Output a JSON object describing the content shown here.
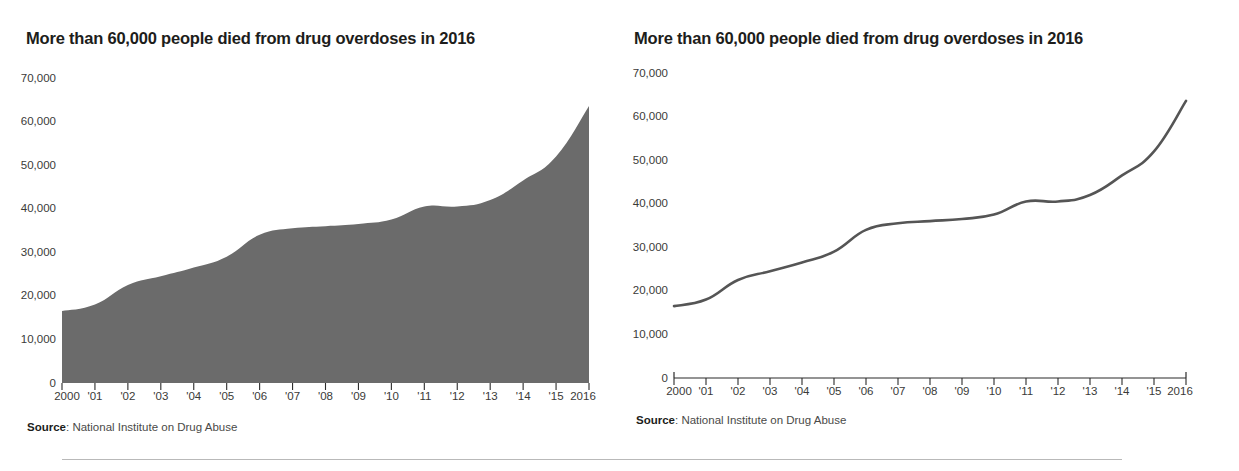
{
  "panels": [
    {
      "key": "area",
      "title": "More than 60,000 people died from drug overdoses in 2016",
      "source_label": "Source",
      "source_text": ": National Institute on Drug Abuse"
    },
    {
      "key": "line",
      "title": "More than 60,000 people died from drug overdoses in 2016",
      "source_label": "Source",
      "source_text": ": National Institute on Drug Abuse"
    }
  ],
  "colors": {
    "area_fill": "#6b6b6b",
    "line_stroke": "#555555",
    "axis": "#2b2b2b",
    "text": "#1d1d1b",
    "divider": "#b9b9b9"
  },
  "chart_data": [
    {
      "type": "area",
      "title": "More than 60,000 people died from drug overdoses in 2016",
      "xlabel": "",
      "ylabel": "",
      "ylim": [
        0,
        70000
      ],
      "xlim": [
        2000,
        2016
      ],
      "grid": false,
      "legend": "none",
      "ytick_labels": [
        "70,000",
        "60,000",
        "50,000",
        "40,000",
        "30,000",
        "20,000",
        "10,000",
        "0"
      ],
      "ytick_values": [
        70000,
        60000,
        50000,
        40000,
        30000,
        20000,
        10000,
        0
      ],
      "xtick_labels": [
        "2000",
        "'01",
        "'02",
        "'03",
        "'04",
        "'05",
        "'06",
        "'07",
        "'08",
        "'09",
        "'10",
        "'11",
        "'12",
        "'13",
        "'14",
        "'15",
        "2016"
      ],
      "x": [
        2000,
        2001,
        2002,
        2003,
        2004,
        2005,
        2006,
        2007,
        2008,
        2009,
        2010,
        2011,
        2012,
        2013,
        2014,
        2015,
        2016
      ],
      "values": [
        16500,
        18000,
        22500,
        24500,
        26500,
        29000,
        34000,
        35500,
        36000,
        36500,
        37500,
        40500,
        40500,
        42000,
        46500,
        52000,
        63600
      ],
      "source": "Source: National Institute on Drug Abuse"
    },
    {
      "type": "line",
      "title": "More than 60,000 people died from drug overdoses in 2016",
      "xlabel": "",
      "ylabel": "",
      "ylim": [
        0,
        70000
      ],
      "xlim": [
        2000,
        2016
      ],
      "grid": false,
      "legend": "none",
      "ytick_labels": [
        "70,000",
        "60,000",
        "50,000",
        "40,000",
        "30,000",
        "20,000",
        "10,000",
        "0"
      ],
      "ytick_values": [
        70000,
        60000,
        50000,
        40000,
        30000,
        20000,
        10000,
        0
      ],
      "xtick_labels": [
        "2000",
        "'01",
        "'02",
        "'03",
        "'04",
        "'05",
        "'06",
        "'07",
        "'08",
        "'09",
        "'10",
        "'11",
        "'12",
        "'13",
        "'14",
        "'15",
        "2016"
      ],
      "x": [
        2000,
        2001,
        2002,
        2003,
        2004,
        2005,
        2006,
        2007,
        2008,
        2009,
        2010,
        2011,
        2012,
        2013,
        2014,
        2015,
        2016
      ],
      "values": [
        16500,
        18000,
        22500,
        24500,
        26500,
        29000,
        34000,
        35500,
        36000,
        36500,
        37500,
        40500,
        40500,
        42000,
        46500,
        52000,
        63600
      ],
      "source": "Source: National Institute on Drug Abuse"
    }
  ]
}
